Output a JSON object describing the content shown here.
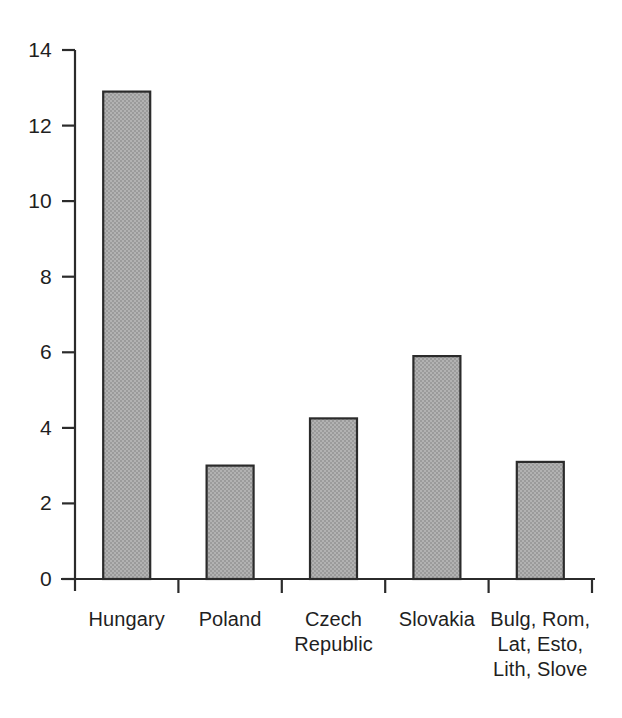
{
  "chart_data": {
    "type": "bar",
    "title": "",
    "subtitle": "",
    "xlabel": "",
    "ylabel": "",
    "categories": [
      "Hungary",
      "Poland",
      "Czech\nRepublic",
      "Slovakia",
      "Bulg, Rom,\nLat, Esto,\nLith, Slove"
    ],
    "values": [
      12.9,
      3.0,
      4.25,
      5.9,
      3.1
    ],
    "ylim": [
      0,
      14
    ],
    "ytick_labels": [
      "0",
      "2",
      "4",
      "6",
      "8",
      "10",
      "12",
      "14"
    ],
    "ytick_values": [
      0,
      2,
      4,
      6,
      8,
      10,
      12,
      14
    ],
    "grid": false,
    "legend": null,
    "bar_fill_color": "#a9a9a9",
    "bar_edge_color": "#2b2b2b",
    "axis_color": "#2b2b2b",
    "background_color": "#ffffff"
  }
}
